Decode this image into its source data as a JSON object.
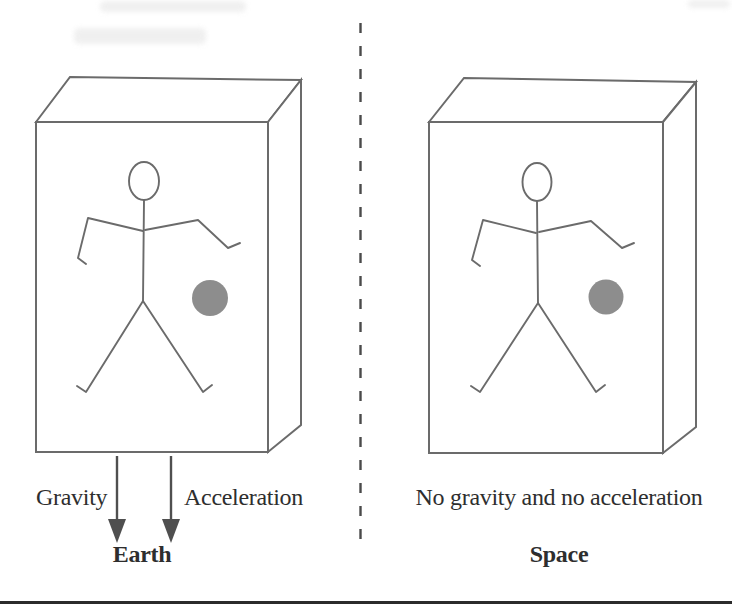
{
  "left_panel": {
    "gravity_label": "Gravity",
    "acceleration_label": "Acceleration",
    "caption": "Earth"
  },
  "right_panel": {
    "condition_label": "No gravity and no acceleration",
    "caption": "Space"
  },
  "drawing": {
    "line_color": "#6b6b6b",
    "ball_color": "#8d8d8d",
    "arrow_color": "#4f4f4f",
    "divider_color": "#4a4a4a",
    "rule_color": "#2b2b2b",
    "text_color": "#2e2e2e"
  }
}
